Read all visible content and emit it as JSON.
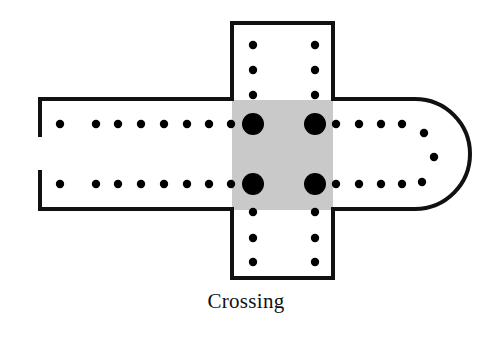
{
  "figure": {
    "caption": "Crossing",
    "colors": {
      "background": "#ffffff",
      "wall_stroke": "#111111",
      "crossing_fill": "#c9c9c9",
      "pier_fill": "#000000",
      "caption_text": "#111111"
    },
    "stroke_width_px": 4
  },
  "plan": {
    "crossing": {
      "label": "Crossing",
      "x": 232,
      "y": 100,
      "width": 101,
      "height": 110,
      "fill": "#c9c9c9"
    },
    "nave_outline_path": "M 38 99 L 232 99 L 232 23 L 333 23 L 333 99 L 415 99 A 55 55 0 0 1 415 209 L 333 209 L 333 278 L 232 278 L 232 209 L 38 209",
    "nave_left_wall_upper": {
      "x1": 38,
      "y1": 99,
      "x2": 38,
      "y2": 137
    },
    "nave_left_wall_lower": {
      "x1": 38,
      "y1": 170,
      "x2": 38,
      "y2": 209
    },
    "west_entrance_gap": {
      "x": 38,
      "y_top": 137,
      "y_bottom": 170
    },
    "apse": {
      "cx": 415,
      "cy": 154,
      "rx": 55,
      "ry": 55,
      "start_angle_deg": -90,
      "end_angle_deg": 90
    }
  },
  "piers": {
    "legend": {
      "major": "large crossing pier",
      "minor": "nave / transept column"
    },
    "major_radius": 11,
    "minor_radius": 4.2,
    "crossing_piers": [
      {
        "name": "crossing-pier-nw",
        "x": 253,
        "y": 124,
        "r": 11
      },
      {
        "name": "crossing-pier-ne",
        "x": 315,
        "y": 124,
        "r": 11
      },
      {
        "name": "crossing-pier-sw",
        "x": 253,
        "y": 184,
        "r": 11
      },
      {
        "name": "crossing-pier-se",
        "x": 315,
        "y": 184,
        "r": 11
      }
    ],
    "nave_north_colonnade": [
      {
        "x": 60,
        "y": 124
      },
      {
        "x": 96,
        "y": 124
      },
      {
        "x": 118,
        "y": 124
      },
      {
        "x": 141,
        "y": 124
      },
      {
        "x": 164,
        "y": 124
      },
      {
        "x": 187,
        "y": 124
      },
      {
        "x": 209,
        "y": 124
      },
      {
        "x": 231,
        "y": 124
      }
    ],
    "nave_south_colonnade": [
      {
        "x": 60,
        "y": 184
      },
      {
        "x": 96,
        "y": 184
      },
      {
        "x": 118,
        "y": 184
      },
      {
        "x": 141,
        "y": 184
      },
      {
        "x": 164,
        "y": 184
      },
      {
        "x": 187,
        "y": 184
      },
      {
        "x": 209,
        "y": 184
      },
      {
        "x": 231,
        "y": 184
      }
    ],
    "choir_north_colonnade": [
      {
        "x": 336,
        "y": 124
      },
      {
        "x": 359,
        "y": 124
      },
      {
        "x": 381,
        "y": 124
      },
      {
        "x": 402,
        "y": 124
      },
      {
        "x": 424,
        "y": 133
      }
    ],
    "choir_south_colonnade": [
      {
        "x": 336,
        "y": 184
      },
      {
        "x": 359,
        "y": 184
      },
      {
        "x": 381,
        "y": 184
      },
      {
        "x": 402,
        "y": 184
      },
      {
        "x": 422,
        "y": 182
      }
    ],
    "apse_ambulatory": [
      {
        "x": 434,
        "y": 157
      }
    ],
    "north_transept_west_row": [
      {
        "x": 253,
        "y": 45
      },
      {
        "x": 253,
        "y": 70
      },
      {
        "x": 253,
        "y": 95
      }
    ],
    "north_transept_east_row": [
      {
        "x": 315,
        "y": 45
      },
      {
        "x": 315,
        "y": 70
      },
      {
        "x": 315,
        "y": 95
      }
    ],
    "south_transept_west_row": [
      {
        "x": 253,
        "y": 212
      },
      {
        "x": 253,
        "y": 238
      },
      {
        "x": 253,
        "y": 262
      }
    ],
    "south_transept_east_row": [
      {
        "x": 315,
        "y": 212
      },
      {
        "x": 315,
        "y": 238
      },
      {
        "x": 315,
        "y": 262
      }
    ]
  }
}
